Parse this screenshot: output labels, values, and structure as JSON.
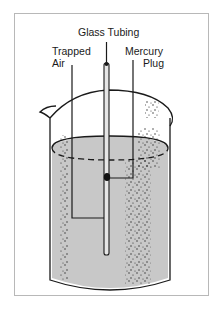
{
  "diagram": {
    "labels": {
      "glass_tubing": "Glass Tubing",
      "trapped_air_line1": "Trapped",
      "trapped_air_line2": "Air",
      "mercury_plug_line1": "Mercury",
      "mercury_plug_line2": "Plug"
    },
    "colors": {
      "liquid": "#c8c8c8",
      "outline": "#1a1a1a",
      "frame": "#b8b8b8",
      "background": "#ffffff"
    }
  }
}
